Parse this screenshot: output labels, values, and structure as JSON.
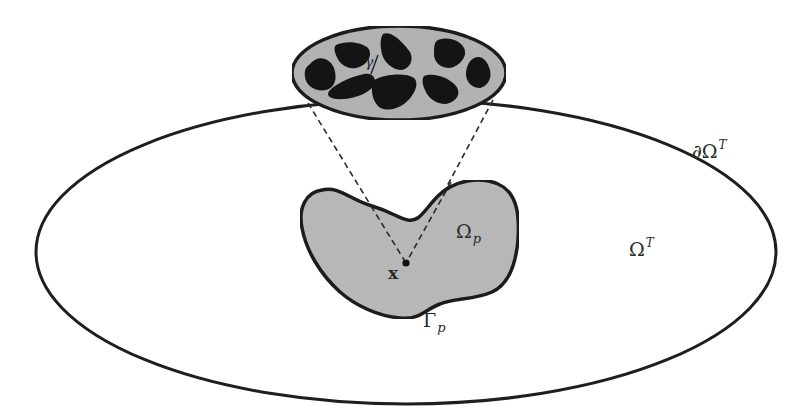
{
  "diagram": {
    "colors": {
      "background": "#ffffff",
      "stroke": "#1e1e1e",
      "subdomain_fill": "#b9b9b9",
      "microstructure_fill": "#b3b3b3",
      "inclusion_fill": "#141414"
    },
    "labels": {
      "boundary_outer": {
        "base": "∂Ω",
        "sup": "T"
      },
      "domain_outer": {
        "base": "Ω",
        "sup": "T"
      },
      "subdomain": {
        "base": "Ω",
        "sub": "p"
      },
      "subdomain_boundary": {
        "base": "Γ",
        "sub": "p"
      },
      "point": "x",
      "micro_interface": "γ"
    },
    "elements": {
      "outer_domain": {
        "shape": "ellipse",
        "cx": 406,
        "cy": 252,
        "rx": 370,
        "ry": 152
      },
      "micro_zoom": {
        "shape": "ellipse",
        "cx": 399,
        "cy": 73,
        "rx": 107,
        "ry": 47,
        "inclusion_count": 9
      },
      "point_x": {
        "cx": 406,
        "cy": 263
      },
      "dashed_lines": [
        {
          "from": [
            308,
            103
          ],
          "to": [
            406,
            263
          ]
        },
        {
          "from": [
            493,
            100
          ],
          "to": [
            406,
            263
          ]
        }
      ]
    }
  }
}
